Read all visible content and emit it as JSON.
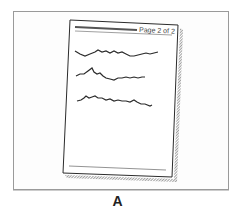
{
  "figure": {
    "page_header_text": "Page 2 of 2",
    "caption": "A",
    "content_lines": 3,
    "colors": {
      "frame_border": "#9a9a9a",
      "ink": "#2b2b2b",
      "header_bar": "#555555",
      "shadow": "#444444"
    }
  }
}
